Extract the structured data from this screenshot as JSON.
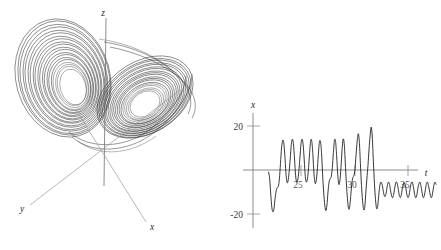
{
  "figure": {
    "background": "#ffffff",
    "ink": "#1a1a1a",
    "axis_color": "#6f6f6f"
  },
  "panels": {
    "phase_portrait": {
      "name": "lorenz-attractor-3d",
      "axes": [
        {
          "key": "z",
          "label": "z"
        },
        {
          "key": "y",
          "label": "y"
        },
        {
          "key": "x",
          "label": "x"
        }
      ]
    },
    "time_series": {
      "name": "x-vs-t-timeseries",
      "ylabel": "x",
      "xlabel": "t",
      "yticks": [
        {
          "value": 20,
          "label": "20"
        },
        {
          "value": -20,
          "label": "-20"
        }
      ],
      "xticks": [
        {
          "value": 25,
          "label": "25"
        },
        {
          "value": 30,
          "label": "30"
        },
        {
          "value": 35,
          "label": "35"
        }
      ]
    }
  },
  "chart_data": {
    "type": "line",
    "title": "",
    "subtitle": "",
    "xlabel": "t",
    "ylabel": "x",
    "xlim": [
      22.0,
      37.5
    ],
    "ylim": [
      -22,
      22
    ],
    "grid": false,
    "legend": null,
    "annotations": [],
    "series": [
      {
        "name": "x(t)",
        "color": "#141414",
        "x": [
          22.0,
          22.1,
          22.2,
          22.3,
          22.4,
          22.5,
          22.6,
          22.7,
          22.8,
          22.9,
          23.0,
          23.1,
          23.2,
          23.3,
          23.4,
          23.5,
          23.6,
          23.7,
          23.8,
          23.9,
          24.0,
          24.1,
          24.2,
          24.3,
          24.4,
          24.5,
          24.6,
          24.7,
          24.8,
          24.9,
          25.0,
          25.1,
          25.2,
          25.3,
          25.4,
          25.5,
          25.6,
          25.7,
          25.8,
          25.9,
          26.0,
          26.1,
          26.2,
          26.3,
          26.4,
          26.5,
          26.6,
          26.7,
          26.8,
          26.9,
          27.0,
          27.1,
          27.2,
          27.3,
          27.4,
          27.5,
          27.6,
          27.7,
          27.8,
          27.9,
          28.0,
          28.1,
          28.2,
          28.3,
          28.4,
          28.5,
          28.6,
          28.7,
          28.8,
          28.9,
          29.0,
          29.1,
          29.2,
          29.3,
          29.4,
          29.5,
          29.6,
          29.7,
          29.8,
          29.9,
          30.0,
          30.1,
          30.2,
          30.3,
          30.4,
          30.5,
          30.6,
          30.7,
          30.8,
          30.9,
          31.0,
          31.1,
          31.2,
          31.3,
          31.4,
          31.5,
          31.6,
          31.7,
          31.8,
          31.9,
          32.0,
          32.1,
          32.2,
          32.3,
          32.4,
          32.5,
          32.6,
          32.7,
          32.8,
          32.9,
          33.0,
          33.1,
          33.2,
          33.3,
          33.4,
          33.5,
          33.6,
          33.7,
          33.8,
          33.9,
          34.0,
          34.1,
          34.2,
          34.3,
          34.4,
          34.5,
          34.6,
          34.7,
          34.8,
          34.9,
          35.0,
          35.1,
          35.2,
          35.3,
          35.4,
          35.5,
          35.6,
          35.7,
          35.8,
          35.9,
          36.0,
          36.1,
          36.2,
          36.3,
          36.4,
          36.5,
          36.6,
          36.7,
          36.8,
          36.9,
          37.0,
          37.1,
          37.2,
          37.3,
          37.4,
          37.5
        ],
        "y": [
          -1.0,
          -4.0,
          -11.0,
          -17.0,
          -19.0,
          -17.5,
          -13.0,
          -9.5,
          -8.0,
          -7.5,
          -4.0,
          3.0,
          10.0,
          13.5,
          12.5,
          7.0,
          -1.0,
          -5.5,
          -5.0,
          -1.0,
          5.0,
          11.5,
          14.0,
          12.0,
          5.0,
          -2.5,
          -5.5,
          -4.5,
          -0.5,
          5.5,
          12.0,
          14.0,
          11.5,
          4.5,
          -3.0,
          -5.5,
          -4.0,
          1.0,
          8.0,
          13.5,
          13.0,
          7.0,
          -1.5,
          -6.0,
          -5.0,
          -0.5,
          6.5,
          12.5,
          13.0,
          8.0,
          -2.0,
          -10.0,
          -16.0,
          -18.5,
          -16.0,
          -10.0,
          -5.5,
          -4.0,
          -3.0,
          1.0,
          8.0,
          13.5,
          13.0,
          6.5,
          -2.0,
          -6.5,
          -5.0,
          1.0,
          9.0,
          14.0,
          12.0,
          3.5,
          -6.0,
          -13.0,
          -17.5,
          -17.0,
          -12.0,
          -6.5,
          -3.5,
          -2.5,
          0.5,
          7.0,
          13.0,
          16.5,
          13.0,
          3.0,
          -7.0,
          -14.0,
          -18.0,
          -17.0,
          -10.5,
          -4.0,
          2.0,
          9.5,
          15.5,
          19.5,
          15.0,
          4.0,
          -6.0,
          -13.5,
          -17.5,
          -16.5,
          -11.5,
          -7.0,
          -5.5,
          -6.5,
          -9.0,
          -11.5,
          -12.0,
          -10.0,
          -7.0,
          -5.5,
          -6.5,
          -9.5,
          -12.0,
          -12.5,
          -10.5,
          -7.5,
          -5.5,
          -6.0,
          -8.5,
          -11.5,
          -12.5,
          -11.0,
          -8.0,
          -6.0,
          -6.0,
          -8.0,
          -11.0,
          -12.5,
          -11.5,
          -8.5,
          -6.0,
          -5.5,
          -7.5,
          -10.5,
          -12.5,
          -12.0,
          -9.0,
          -6.5,
          -5.5,
          -7.0,
          -10.0,
          -12.5,
          -12.0,
          -9.5,
          -6.5,
          -5.5,
          -7.0,
          -9.5,
          -12.0,
          -12.5,
          -10.0,
          -7.0,
          -5.5,
          -6.5
        ]
      }
    ]
  }
}
